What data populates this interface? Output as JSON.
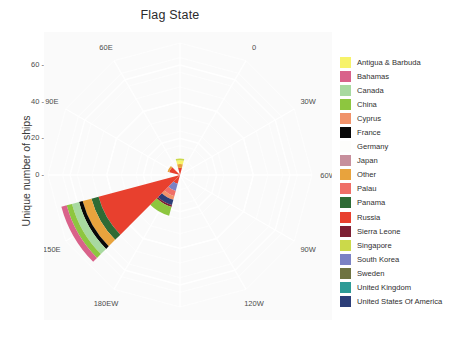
{
  "figure": {
    "title": "Flag State",
    "background_color": "#ffffff",
    "panel_background_color": "#fafafa",
    "grid_color": "#ffffff",
    "text_color": "#4d4d4d"
  },
  "axes": {
    "y_axis_title": "Unique number of ships",
    "y_ticks": [
      {
        "label": "0",
        "value": 0
      },
      {
        "label": "20",
        "value": 20
      },
      {
        "label": "40",
        "value": 40
      },
      {
        "label": "60",
        "value": 60
      }
    ],
    "y_limits": [
      0,
      72
    ],
    "theta_ticks": [
      {
        "label": "0",
        "deg": 0
      },
      {
        "label": "30W",
        "deg": 30
      },
      {
        "label": "60W",
        "deg": 60
      },
      {
        "label": "90W",
        "deg": 90
      },
      {
        "label": "120W",
        "deg": 120
      },
      {
        "label": "150W",
        "deg": 150
      },
      {
        "label": "180EW",
        "deg": 180
      },
      {
        "label": "150E",
        "deg": 210
      },
      {
        "label": "120E",
        "deg": 240
      },
      {
        "label": "90E",
        "deg": 270
      },
      {
        "label": "60E",
        "deg": 300
      },
      {
        "label": "30E",
        "deg": 330
      }
    ]
  },
  "legend": {
    "title": "",
    "items": [
      {
        "label": "Antigua & Barbuda",
        "color": "#f7f36a"
      },
      {
        "label": "Bahamas",
        "color": "#d9628a"
      },
      {
        "label": "Canada",
        "color": "#a8d9a0"
      },
      {
        "label": "China",
        "color": "#8dc63f"
      },
      {
        "label": "Cyprus",
        "color": "#f0926a"
      },
      {
        "label": "France",
        "color": "#080808"
      },
      {
        "label": "Germany",
        "color": "#fdfdfb"
      },
      {
        "label": "Japan",
        "color": "#c78f9c"
      },
      {
        "label": "Other",
        "color": "#e8a33d"
      },
      {
        "label": "Palau",
        "color": "#ef6f68"
      },
      {
        "label": "Panama",
        "color": "#2e6b35"
      },
      {
        "label": "Russia",
        "color": "#e8402e"
      },
      {
        "label": "Sierra Leone",
        "color": "#7d1f34"
      },
      {
        "label": "Singapore",
        "color": "#cbd94a"
      },
      {
        "label": "South Korea",
        "color": "#7b82c4"
      },
      {
        "label": "Sweden",
        "color": "#6e7341"
      },
      {
        "label": "United Kingdom",
        "color": "#2c9a96"
      },
      {
        "label": "United States Of America",
        "color": "#2c3e78"
      }
    ]
  },
  "chart_data": {
    "type": "bar",
    "subtype": "polar-stacked-windrose",
    "title": "Flag State",
    "xlabel": "",
    "ylabel": "Unique number of ships",
    "ylim": [
      0,
      72
    ],
    "grid": true,
    "legend_position": "right",
    "theta_direction": "clockwise-from-north-west",
    "categories": [
      "0",
      "30W",
      "60W",
      "90W",
      "120W",
      "150W",
      "180EW",
      "150E",
      "120E",
      "90E",
      "60E",
      "30E"
    ],
    "note": "Each angular sector is a 30-degree longitude bin; bars are stacked by flag state.",
    "series": [
      {
        "name": "Antigua & Barbuda",
        "color": "#f7f36a",
        "values": [
          0,
          0,
          0,
          0,
          0,
          0,
          0,
          0,
          0,
          0,
          0,
          2
        ]
      },
      {
        "name": "Bahamas",
        "color": "#d9628a",
        "values": [
          0,
          0,
          0,
          0,
          0,
          0,
          0,
          3,
          0,
          0,
          0,
          0
        ]
      },
      {
        "name": "Canada",
        "color": "#a8d9a0",
        "values": [
          0,
          0,
          0,
          0,
          0,
          0,
          0,
          4,
          0,
          0,
          0,
          0
        ]
      },
      {
        "name": "China",
        "color": "#8dc63f",
        "values": [
          0,
          0,
          0,
          0,
          0,
          0,
          5,
          3,
          0,
          0,
          0,
          0
        ]
      },
      {
        "name": "Cyprus",
        "color": "#f0926a",
        "values": [
          0,
          0,
          0,
          0,
          0,
          0,
          2,
          0,
          0,
          0,
          0,
          0
        ]
      },
      {
        "name": "France",
        "color": "#080808",
        "values": [
          0,
          0,
          0,
          0,
          0,
          0,
          0,
          2,
          0,
          0,
          0,
          0
        ]
      },
      {
        "name": "Germany",
        "color": "#fdfdfb",
        "values": [
          0,
          0,
          0,
          0,
          0,
          0,
          0,
          0,
          0,
          0,
          0,
          0
        ]
      },
      {
        "name": "Japan",
        "color": "#c78f9c",
        "values": [
          0,
          0,
          0,
          0,
          0,
          0,
          0,
          3,
          0,
          0,
          0,
          0
        ]
      },
      {
        "name": "Other",
        "color": "#e8a33d",
        "values": [
          1,
          0,
          0,
          0,
          0,
          0,
          0,
          5,
          0,
          0,
          0,
          2
        ]
      },
      {
        "name": "Palau",
        "color": "#ef6f68",
        "values": [
          0,
          0,
          0,
          0,
          0,
          0,
          3,
          0,
          0,
          0,
          0,
          0
        ]
      },
      {
        "name": "Panama",
        "color": "#2e6b35",
        "values": [
          0,
          0,
          0,
          0,
          0,
          0,
          0,
          4,
          0,
          0,
          0,
          0
        ]
      },
      {
        "name": "Russia",
        "color": "#e8402e",
        "values": [
          6,
          0,
          0,
          0,
          0,
          0,
          5,
          46,
          0,
          0,
          0,
          4
        ]
      },
      {
        "name": "Sierra Leone",
        "color": "#7d1f34",
        "values": [
          0,
          0,
          0,
          0,
          0,
          0,
          1,
          0,
          0,
          0,
          0,
          0
        ]
      },
      {
        "name": "Singapore",
        "color": "#cbd94a",
        "values": [
          0,
          0,
          0,
          0,
          0,
          0,
          0,
          0,
          0,
          0,
          0,
          1
        ]
      },
      {
        "name": "South Korea",
        "color": "#7b82c4",
        "values": [
          0,
          0,
          0,
          0,
          0,
          0,
          4,
          0,
          0,
          0,
          0,
          0
        ]
      },
      {
        "name": "Sweden",
        "color": "#6e7341",
        "values": [
          0,
          0,
          0,
          0,
          0,
          0,
          0,
          0,
          0,
          0,
          0,
          0
        ]
      },
      {
        "name": "United Kingdom",
        "color": "#2c9a96",
        "values": [
          0,
          0,
          0,
          0,
          0,
          0,
          0,
          0,
          0,
          0,
          0,
          0
        ]
      },
      {
        "name": "United States Of America",
        "color": "#2c3e78",
        "values": [
          0,
          0,
          0,
          0,
          0,
          0,
          3,
          0,
          0,
          0,
          0,
          0
        ]
      }
    ],
    "sector_stacks": [
      {
        "theta_label": "0",
        "center_deg": 0,
        "stack": []
      },
      {
        "theta_label": "30W",
        "center_deg": 30,
        "stack": []
      },
      {
        "theta_label": "60W",
        "center_deg": 60,
        "stack": []
      },
      {
        "theta_label": "90W",
        "center_deg": 90,
        "stack": []
      },
      {
        "theta_label": "120W",
        "center_deg": 120,
        "stack": []
      },
      {
        "theta_label": "150W",
        "center_deg": 150,
        "stack": []
      },
      {
        "theta_label": "180EW",
        "center_deg": 180,
        "stack": [
          {
            "name": "Russia",
            "color": "#e8402e",
            "value": 5
          },
          {
            "name": "South Korea",
            "color": "#7b82c4",
            "value": 4
          },
          {
            "name": "Palau",
            "color": "#ef6f68",
            "value": 3
          },
          {
            "name": "Cyprus",
            "color": "#f0926a",
            "value": 2
          },
          {
            "name": "United States Of America",
            "color": "#2c3e78",
            "value": 3
          },
          {
            "name": "Sierra Leone",
            "color": "#7d1f34",
            "value": 1
          },
          {
            "name": "China",
            "color": "#8dc63f",
            "value": 5
          }
        ]
      },
      {
        "theta_label": "150E",
        "center_deg": 210,
        "stack": [
          {
            "name": "Russia",
            "color": "#e8402e",
            "value": 46
          },
          {
            "name": "Panama",
            "color": "#2e6b35",
            "value": 4
          },
          {
            "name": "Other",
            "color": "#e8a33d",
            "value": 5
          },
          {
            "name": "France",
            "color": "#080808",
            "value": 2
          },
          {
            "name": "Canada",
            "color": "#a8d9a0",
            "value": 4
          },
          {
            "name": "China",
            "color": "#8dc63f",
            "value": 3
          },
          {
            "name": "Bahamas",
            "color": "#d9628a",
            "value": 3
          }
        ]
      },
      {
        "theta_label": "120E",
        "center_deg": 240,
        "stack": []
      },
      {
        "theta_label": "90E",
        "center_deg": 270,
        "stack": [
          {
            "name": "Russia",
            "color": "#e8402e",
            "value": 6
          },
          {
            "name": "Other",
            "color": "#e8a33d",
            "value": 1
          }
        ]
      },
      {
        "theta_label": "60E",
        "center_deg": 300,
        "stack": []
      },
      {
        "theta_label": "30E",
        "center_deg": 330,
        "stack": [
          {
            "name": "Russia",
            "color": "#e8402e",
            "value": 4
          },
          {
            "name": "Other",
            "color": "#e8a33d",
            "value": 2
          },
          {
            "name": "Antigua & Barbuda",
            "color": "#f7f36a",
            "value": 2
          },
          {
            "name": "Singapore",
            "color": "#cbd94a",
            "value": 1
          }
        ]
      }
    ]
  }
}
